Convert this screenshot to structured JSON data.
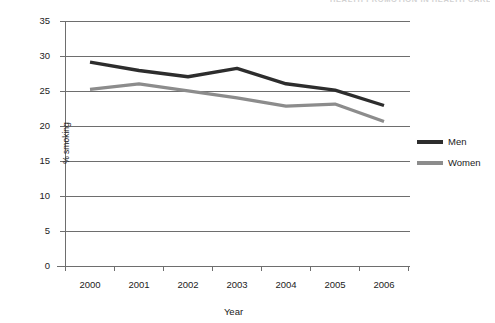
{
  "running_head": "HEALTH PROMOTION IN HEALTH CARE",
  "chart_data": {
    "type": "line",
    "title": "",
    "subtitle": "",
    "xlabel": "Year",
    "ylabel": "% smoking",
    "categories": [
      "2000",
      "2001",
      "2002",
      "2003",
      "2004",
      "2005",
      "2006"
    ],
    "x": [
      2000,
      2001,
      2002,
      2003,
      2004,
      2005,
      2006
    ],
    "series": [
      {
        "name": "Men",
        "color": "#2d2d2d",
        "values": [
          29.2,
          28.0,
          27.1,
          28.3,
          26.1,
          25.2,
          23.0
        ]
      },
      {
        "name": "Women",
        "color": "#8c8c8c",
        "values": [
          25.3,
          26.1,
          25.1,
          24.1,
          22.9,
          23.2,
          20.7
        ]
      }
    ],
    "ylim": [
      0,
      35
    ],
    "yticks": [
      0,
      5,
      10,
      15,
      20,
      25,
      30,
      35
    ],
    "ytick_labels": [
      "0",
      "5",
      "10",
      "15",
      "20",
      "25",
      "30",
      "35"
    ],
    "grid": "horizontal",
    "legend_position": "right",
    "background": "#ffffff",
    "gridline_color": "#6e6e6e",
    "axis_color": "#6e6e6e"
  },
  "legend": {
    "items": [
      {
        "label": "Men",
        "color": "#2d2d2d"
      },
      {
        "label": "Women",
        "color": "#8c8c8c"
      }
    ]
  },
  "axes": {
    "y_label": "% smoking",
    "x_label": "Year",
    "y_ticks": [
      "35",
      "30",
      "25",
      "20",
      "15",
      "10",
      "5",
      "0"
    ],
    "x_ticks": [
      "2000",
      "2001",
      "2002",
      "2003",
      "2004",
      "2005",
      "2006"
    ]
  }
}
